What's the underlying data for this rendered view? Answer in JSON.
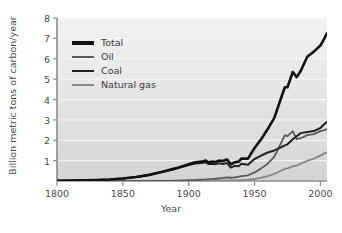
{
  "chart_data": {
    "type": "line",
    "title": "",
    "subtitle": "",
    "xlabel": "Year",
    "ylabel": "Billion metric tons of carbon/year",
    "xlim": [
      1800,
      2005
    ],
    "ylim": [
      0,
      8
    ],
    "xticks": [
      1800,
      1850,
      1900,
      1950,
      2000
    ],
    "xtick_labels": [
      "1800",
      "1850",
      "1900",
      "1950",
      "2000"
    ],
    "yticks": [
      1,
      2,
      3,
      4,
      5,
      6,
      7,
      8
    ],
    "ytick_labels": [
      "1",
      "2",
      "3",
      "4",
      "5",
      "6",
      "7",
      "8"
    ],
    "grid": "horizontal-faint",
    "legend_position": "upper-left-inside",
    "x": [
      1800,
      1810,
      1820,
      1830,
      1840,
      1850,
      1860,
      1870,
      1880,
      1890,
      1900,
      1905,
      1910,
      1913,
      1915,
      1918,
      1920,
      1923,
      1926,
      1929,
      1932,
      1935,
      1938,
      1940,
      1945,
      1950,
      1955,
      1960,
      1965,
      1970,
      1973,
      1975,
      1979,
      1982,
      1985,
      1990,
      1995,
      2000,
      2003,
      2005
    ],
    "series": [
      {
        "name": "Total",
        "color": "#111111",
        "values": [
          0.01,
          0.02,
          0.03,
          0.05,
          0.07,
          0.12,
          0.2,
          0.3,
          0.45,
          0.62,
          0.82,
          0.92,
          0.95,
          1.0,
          0.92,
          0.95,
          0.93,
          1.0,
          0.98,
          1.06,
          0.82,
          0.92,
          0.95,
          1.1,
          1.1,
          1.62,
          2.05,
          2.55,
          3.1,
          4.05,
          4.6,
          4.6,
          5.35,
          5.1,
          5.4,
          6.1,
          6.35,
          6.65,
          7.0,
          7.25
        ]
      },
      {
        "name": "Oil",
        "color": "#5a5a5a",
        "values": [
          0.0,
          0.0,
          0.0,
          0.0,
          0.0,
          0.0,
          0.0,
          0.0,
          0.01,
          0.02,
          0.04,
          0.05,
          0.07,
          0.08,
          0.09,
          0.1,
          0.11,
          0.13,
          0.15,
          0.18,
          0.16,
          0.18,
          0.21,
          0.24,
          0.28,
          0.42,
          0.62,
          0.85,
          1.2,
          1.85,
          2.25,
          2.2,
          2.45,
          2.05,
          2.1,
          2.25,
          2.3,
          2.45,
          2.5,
          2.55
        ]
      },
      {
        "name": "Coal",
        "color": "#222222",
        "values": [
          0.01,
          0.02,
          0.03,
          0.05,
          0.07,
          0.12,
          0.2,
          0.3,
          0.44,
          0.6,
          0.78,
          0.86,
          0.88,
          0.92,
          0.83,
          0.85,
          0.82,
          0.87,
          0.83,
          0.88,
          0.66,
          0.74,
          0.73,
          0.85,
          0.8,
          1.08,
          1.25,
          1.4,
          1.5,
          1.65,
          1.75,
          1.8,
          2.05,
          2.2,
          2.35,
          2.4,
          2.45,
          2.6,
          2.8,
          2.9
        ]
      },
      {
        "name": "Natural gas",
        "color": "#8a8a8a",
        "values": [
          0.0,
          0.0,
          0.0,
          0.0,
          0.0,
          0.0,
          0.0,
          0.0,
          0.0,
          0.0,
          0.0,
          0.0,
          0.01,
          0.01,
          0.01,
          0.01,
          0.02,
          0.02,
          0.03,
          0.03,
          0.03,
          0.04,
          0.04,
          0.05,
          0.06,
          0.1,
          0.16,
          0.24,
          0.35,
          0.5,
          0.6,
          0.62,
          0.72,
          0.75,
          0.85,
          0.99,
          1.1,
          1.25,
          1.35,
          1.4
        ]
      }
    ]
  },
  "legend": {
    "items": [
      {
        "label": "Total",
        "color": "#111111"
      },
      {
        "label": "Oil",
        "color": "#5a5a5a"
      },
      {
        "label": "Coal",
        "color": "#222222"
      },
      {
        "label": "Natural gas",
        "color": "#8a8a8a"
      }
    ]
  },
  "axes": {
    "x_title": "Year",
    "y_title": "Billion metric tons of carbon/year",
    "x_tick_labels": [
      "1800",
      "1850",
      "1900",
      "1950",
      "2000"
    ],
    "y_tick_labels": [
      "1",
      "2",
      "3",
      "4",
      "5",
      "6",
      "7",
      "8"
    ]
  },
  "colors": {
    "plot_background_top": "#f0f0f0",
    "plot_background_bottom": "#d8d8d8",
    "axis": "#808080",
    "text": "#4a4a4a",
    "gridline": "#f7f7f7",
    "page_background": "#ffffff"
  }
}
